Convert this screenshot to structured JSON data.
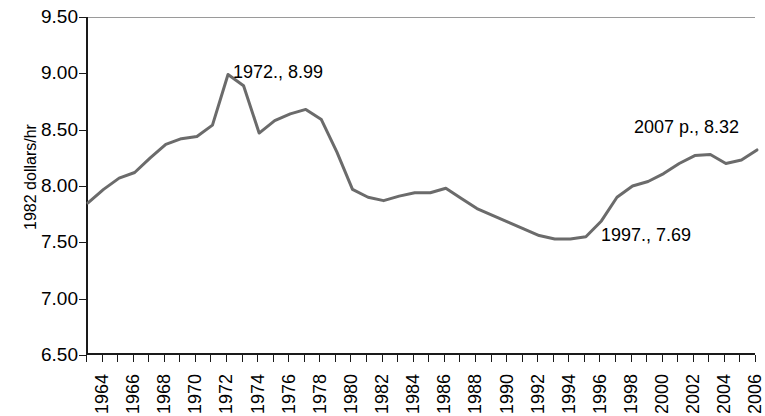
{
  "chart_data": {
    "type": "line",
    "title": "",
    "xlabel": "",
    "ylabel": "1982 dollars/hr",
    "xlim": [
      1964,
      2007
    ],
    "ylim": [
      6.5,
      9.5
    ],
    "grid": false,
    "legend": "none",
    "series": [
      {
        "name": "Average hourly earnings (1982 dollars)",
        "x": [
          1964,
          1965,
          1966,
          1967,
          1968,
          1969,
          1970,
          1971,
          1972,
          1973,
          1974,
          1975,
          1976,
          1977,
          1978,
          1979,
          1980,
          1981,
          1982,
          1983,
          1984,
          1985,
          1986,
          1987,
          1988,
          1989,
          1990,
          1991,
          1992,
          1993,
          1994,
          1995,
          1996,
          1997,
          1998,
          1999,
          2000,
          2001,
          2002,
          2003,
          2004,
          2005,
          2006,
          2007
        ],
        "values": [
          7.85,
          7.97,
          8.07,
          8.12,
          8.25,
          8.37,
          8.42,
          8.44,
          8.54,
          8.99,
          8.89,
          8.47,
          8.58,
          8.64,
          8.68,
          8.59,
          8.3,
          7.97,
          7.9,
          7.87,
          7.91,
          7.94,
          7.94,
          7.98,
          7.89,
          7.8,
          7.74,
          7.68,
          7.62,
          7.56,
          7.53,
          7.53,
          7.55,
          7.69,
          7.9,
          8.0,
          8.04,
          8.11,
          8.2,
          8.27,
          8.28,
          8.2,
          8.23,
          8.32
        ]
      }
    ],
    "y_ticks": [
      "6.50",
      "7.00",
      "7.50",
      "8.00",
      "8.50",
      "9.00",
      "9.50"
    ],
    "y_tick_values": [
      6.5,
      7.0,
      7.5,
      8.0,
      8.5,
      9.0,
      9.5
    ],
    "x_tick_labels": [
      "1964",
      "1966",
      "1968",
      "1970",
      "1972",
      "1974",
      "1976",
      "1978",
      "1980",
      "1982",
      "1984",
      "1986",
      "1988",
      "1990",
      "1992",
      "1994",
      "1996",
      "1998",
      "2000",
      "2002",
      "2004",
      "2006"
    ],
    "x_tick_values": [
      1964,
      1966,
      1968,
      1970,
      1972,
      1974,
      1976,
      1978,
      1980,
      1982,
      1984,
      1986,
      1988,
      1990,
      1992,
      1994,
      1996,
      1998,
      2000,
      2002,
      2004,
      2006
    ],
    "x_minor_ticks": [
      1964,
      1965,
      1966,
      1967,
      1968,
      1969,
      1970,
      1971,
      1972,
      1973,
      1974,
      1975,
      1976,
      1977,
      1978,
      1979,
      1980,
      1981,
      1982,
      1983,
      1984,
      1985,
      1986,
      1987,
      1988,
      1989,
      1990,
      1991,
      1992,
      1993,
      1994,
      1995,
      1996,
      1997,
      1998,
      1999,
      2000,
      2001,
      2002,
      2003,
      2004,
      2005,
      2006,
      2007
    ],
    "annotations": [
      {
        "text": "1972., 8.99",
        "x": 1973,
        "y": 8.99,
        "px": 233,
        "py": 63
      },
      {
        "text": "2007 p., 8.32",
        "x": 2007,
        "y": 8.32,
        "px": 634,
        "py": 118
      },
      {
        "text": "1997., 7.69",
        "x": 1997,
        "y": 7.69,
        "px": 601,
        "py": 226
      }
    ],
    "series_color": "#6b6b6b",
    "axis_color": "#1a1a1a",
    "gridline_color": "#9a9a9a",
    "background_color": "#ffffff"
  }
}
